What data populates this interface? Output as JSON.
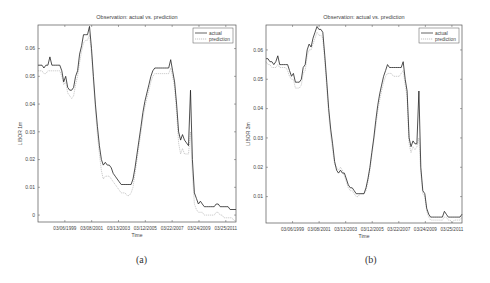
{
  "colors": {
    "actual": "#222222",
    "prediction": "#aaaaaa",
    "axis": "#555555",
    "text": "#444444"
  },
  "chart_data": [
    {
      "type": "line",
      "panel": "(a)",
      "title": "Observation: actual vs. prediction",
      "xlabel": "Time",
      "ylabel": "LIBOR 1m",
      "xtick_labels": [
        "03/06/1999",
        "03/08/2001",
        "03/13/2003",
        "03/12/2005",
        "03/22/2007",
        "03/24/2009",
        "03/25/2011"
      ],
      "yticks": [
        0,
        0.01,
        0.02,
        0.03,
        0.04,
        0.05,
        0.06
      ],
      "ytick_labels": [
        "0",
        "0.01",
        "0.02",
        "0.03",
        "0.04",
        "0.05",
        "0.06"
      ],
      "ylim": [
        -0.0025,
        0.0685
      ],
      "xlim": [
        0,
        100
      ],
      "legend": {
        "position": "upper right",
        "entries": [
          "actual",
          "prediction"
        ]
      },
      "grid": false,
      "series": [
        {
          "name": "actual",
          "x": [
            0,
            1,
            2,
            3,
            4,
            5,
            6,
            7,
            8,
            9,
            10,
            11,
            12,
            13,
            14,
            15,
            16,
            17,
            18,
            19,
            20,
            21,
            22,
            23,
            24,
            25,
            26,
            27,
            28,
            29,
            30,
            31,
            32,
            33,
            34,
            35,
            36,
            37,
            38,
            39,
            40,
            41,
            42,
            43,
            44,
            45,
            46,
            47,
            48,
            49,
            50,
            51,
            52,
            53,
            54,
            55,
            56,
            57,
            58,
            59,
            60,
            61,
            62,
            63,
            64,
            65,
            66,
            67,
            68,
            69,
            70,
            71,
            72,
            73,
            74,
            75,
            76,
            77,
            78,
            79,
            80,
            81,
            82,
            83,
            84,
            85,
            86,
            87,
            88,
            89,
            90,
            91,
            92,
            93,
            94,
            95,
            96,
            97,
            98,
            99,
            100
          ],
          "y": [
            0.054,
            0.054,
            0.054,
            0.053,
            0.054,
            0.054,
            0.057,
            0.054,
            0.054,
            0.054,
            0.054,
            0.054,
            0.052,
            0.048,
            0.05,
            0.046,
            0.045,
            0.045,
            0.046,
            0.05,
            0.052,
            0.058,
            0.061,
            0.065,
            0.065,
            0.065,
            0.068,
            0.06,
            0.05,
            0.04,
            0.032,
            0.025,
            0.02,
            0.018,
            0.019,
            0.018,
            0.018,
            0.017,
            0.015,
            0.014,
            0.013,
            0.012,
            0.011,
            0.011,
            0.011,
            0.011,
            0.011,
            0.011,
            0.013,
            0.017,
            0.022,
            0.027,
            0.032,
            0.037,
            0.041,
            0.044,
            0.047,
            0.05,
            0.052,
            0.053,
            0.053,
            0.053,
            0.053,
            0.053,
            0.053,
            0.053,
            0.053,
            0.056,
            0.052,
            0.048,
            0.04,
            0.03,
            0.027,
            0.029,
            0.027,
            0.026,
            0.025,
            0.045,
            0.02,
            0.008,
            0.006,
            0.004,
            0.005,
            0.004,
            0.003,
            0.003,
            0.003,
            0.003,
            0.003,
            0.003,
            0.004,
            0.004,
            0.003,
            0.003,
            0.003,
            0.003,
            0.003,
            0.002,
            0.002,
            0.002,
            0.002
          ]
        },
        {
          "name": "prediction",
          "x": [
            0,
            1,
            2,
            3,
            4,
            5,
            6,
            7,
            8,
            9,
            10,
            11,
            12,
            13,
            14,
            15,
            16,
            17,
            18,
            19,
            20,
            21,
            22,
            23,
            24,
            25,
            26,
            27,
            28,
            29,
            30,
            31,
            32,
            33,
            34,
            35,
            36,
            37,
            38,
            39,
            40,
            41,
            42,
            43,
            44,
            45,
            46,
            47,
            48,
            49,
            50,
            51,
            52,
            53,
            54,
            55,
            56,
            57,
            58,
            59,
            60,
            61,
            62,
            63,
            64,
            65,
            66,
            67,
            68,
            69,
            70,
            71,
            72,
            73,
            74,
            75,
            76,
            77,
            78,
            79,
            80,
            81,
            82,
            83,
            84,
            85,
            86,
            87,
            88,
            89,
            90,
            91,
            92,
            93,
            94,
            95,
            96,
            97,
            98,
            99,
            100
          ],
          "y": [
            0.052,
            0.052,
            0.052,
            0.051,
            0.051,
            0.052,
            0.052,
            0.052,
            0.052,
            0.052,
            0.052,
            0.052,
            0.05,
            0.047,
            0.048,
            0.044,
            0.043,
            0.042,
            0.043,
            0.047,
            0.05,
            0.055,
            0.059,
            0.062,
            0.063,
            0.063,
            0.065,
            0.058,
            0.048,
            0.038,
            0.029,
            0.022,
            0.016,
            0.013,
            0.014,
            0.014,
            0.014,
            0.013,
            0.012,
            0.011,
            0.01,
            0.009,
            0.008,
            0.008,
            0.008,
            0.007,
            0.007,
            0.008,
            0.01,
            0.015,
            0.02,
            0.025,
            0.03,
            0.035,
            0.039,
            0.042,
            0.045,
            0.048,
            0.05,
            0.051,
            0.051,
            0.051,
            0.051,
            0.051,
            0.051,
            0.051,
            0.051,
            0.053,
            0.05,
            0.046,
            0.037,
            0.026,
            0.022,
            0.024,
            0.022,
            0.022,
            0.022,
            0.03,
            0.015,
            0.004,
            0.002,
            0.001,
            0.001,
            0.001,
            0.0,
            0.0,
            0.0,
            0.0,
            0.0,
            0.0,
            0.001,
            0.001,
            0.0,
            0.0,
            -0.001,
            -0.001,
            -0.001,
            -0.001,
            -0.001,
            -0.002,
            -0.002
          ]
        }
      ]
    },
    {
      "type": "line",
      "panel": "(b)",
      "title": "Observation: actual vs. prediction",
      "xlabel": "Time",
      "ylabel": "LIBOR 3m",
      "xtick_labels": [
        "03/06/1999",
        "03/08/2001",
        "03/13/2003",
        "03/12/2005",
        "03/22/2007",
        "03/24/2009",
        "03/25/2011"
      ],
      "yticks": [
        0.01,
        0.02,
        0.03,
        0.04,
        0.05,
        0.06
      ],
      "ytick_labels": [
        "0.01",
        "0.02",
        "0.03",
        "0.04",
        "0.05",
        "0.06"
      ],
      "ylim": [
        0.001,
        0.0685
      ],
      "xlim": [
        0,
        100
      ],
      "legend": {
        "position": "upper right",
        "entries": [
          "actual",
          "prediction"
        ]
      },
      "grid": false,
      "series": [
        {
          "name": "actual",
          "x": [
            0,
            1,
            2,
            3,
            4,
            5,
            6,
            7,
            8,
            9,
            10,
            11,
            12,
            13,
            14,
            15,
            16,
            17,
            18,
            19,
            20,
            21,
            22,
            23,
            24,
            25,
            26,
            27,
            28,
            29,
            30,
            31,
            32,
            33,
            34,
            35,
            36,
            37,
            38,
            39,
            40,
            41,
            42,
            43,
            44,
            45,
            46,
            47,
            48,
            49,
            50,
            51,
            52,
            53,
            54,
            55,
            56,
            57,
            58,
            59,
            60,
            61,
            62,
            63,
            64,
            65,
            66,
            67,
            68,
            69,
            70,
            71,
            72,
            73,
            74,
            75,
            76,
            77,
            78,
            79,
            80,
            81,
            82,
            83,
            84,
            85,
            86,
            87,
            88,
            89,
            90,
            91,
            92,
            93,
            94,
            95,
            96,
            97,
            98,
            99,
            100
          ],
          "y": [
            0.057,
            0.057,
            0.056,
            0.056,
            0.055,
            0.056,
            0.058,
            0.055,
            0.055,
            0.055,
            0.055,
            0.055,
            0.053,
            0.051,
            0.052,
            0.049,
            0.049,
            0.049,
            0.05,
            0.054,
            0.055,
            0.06,
            0.062,
            0.061,
            0.064,
            0.066,
            0.068,
            0.067,
            0.067,
            0.066,
            0.058,
            0.049,
            0.04,
            0.033,
            0.028,
            0.022,
            0.019,
            0.018,
            0.019,
            0.018,
            0.018,
            0.016,
            0.014,
            0.013,
            0.013,
            0.012,
            0.011,
            0.011,
            0.011,
            0.011,
            0.011,
            0.013,
            0.016,
            0.02,
            0.025,
            0.03,
            0.036,
            0.041,
            0.045,
            0.048,
            0.051,
            0.053,
            0.055,
            0.054,
            0.054,
            0.054,
            0.054,
            0.054,
            0.054,
            0.054,
            0.056,
            0.05,
            0.046,
            0.03,
            0.027,
            0.029,
            0.028,
            0.028,
            0.046,
            0.02,
            0.012,
            0.011,
            0.006,
            0.004,
            0.003,
            0.003,
            0.003,
            0.003,
            0.003,
            0.003,
            0.003,
            0.005,
            0.004,
            0.003,
            0.003,
            0.003,
            0.003,
            0.003,
            0.003,
            0.003,
            0.004
          ]
        },
        {
          "name": "prediction",
          "x": [
            0,
            1,
            2,
            3,
            4,
            5,
            6,
            7,
            8,
            9,
            10,
            11,
            12,
            13,
            14,
            15,
            16,
            17,
            18,
            19,
            20,
            21,
            22,
            23,
            24,
            25,
            26,
            27,
            28,
            29,
            30,
            31,
            32,
            33,
            34,
            35,
            36,
            37,
            38,
            39,
            40,
            41,
            42,
            43,
            44,
            45,
            46,
            47,
            48,
            49,
            50,
            51,
            52,
            53,
            54,
            55,
            56,
            57,
            58,
            59,
            60,
            61,
            62,
            63,
            64,
            65,
            66,
            67,
            68,
            69,
            70,
            71,
            72,
            73,
            74,
            75,
            76,
            77,
            78,
            79,
            80,
            81,
            82,
            83,
            84,
            85,
            86,
            87,
            88,
            89,
            90,
            91,
            92,
            93,
            94,
            95,
            96,
            97,
            98,
            99,
            100
          ],
          "y": [
            0.056,
            0.055,
            0.055,
            0.054,
            0.054,
            0.054,
            0.055,
            0.054,
            0.054,
            0.054,
            0.054,
            0.053,
            0.051,
            0.05,
            0.05,
            0.047,
            0.047,
            0.047,
            0.048,
            0.052,
            0.053,
            0.058,
            0.06,
            0.06,
            0.062,
            0.064,
            0.066,
            0.065,
            0.065,
            0.064,
            0.056,
            0.047,
            0.038,
            0.031,
            0.026,
            0.021,
            0.02,
            0.019,
            0.02,
            0.019,
            0.017,
            0.015,
            0.013,
            0.012,
            0.012,
            0.011,
            0.01,
            0.01,
            0.011,
            0.011,
            0.011,
            0.012,
            0.015,
            0.019,
            0.024,
            0.029,
            0.034,
            0.039,
            0.043,
            0.046,
            0.049,
            0.051,
            0.052,
            0.052,
            0.052,
            0.051,
            0.051,
            0.051,
            0.051,
            0.052,
            0.053,
            0.048,
            0.044,
            0.028,
            0.025,
            0.027,
            0.026,
            0.027,
            0.03,
            0.018,
            0.011,
            0.01,
            0.005,
            0.003,
            0.002,
            0.002,
            0.002,
            0.002,
            0.002,
            0.002,
            0.002,
            0.003,
            0.003,
            0.002,
            0.002,
            0.001,
            0.002,
            0.002,
            0.002,
            0.002,
            0.003
          ]
        }
      ]
    }
  ],
  "captions": {
    "a": "(a)",
    "b": "(b)"
  }
}
